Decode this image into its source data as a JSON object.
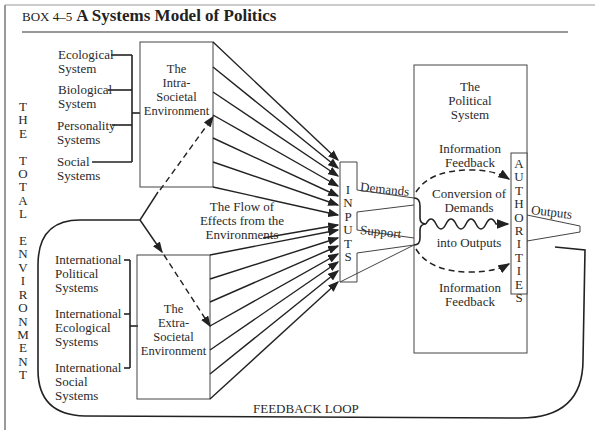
{
  "header": {
    "box_label": "BOX 4–5",
    "title": "A Systems Model of Politics"
  },
  "side_label": "T\nH\nE\n\nT\nO\nT\nA\nL\n\nE\nN\nV\nI\nR\nO\nN\nM\nE\nN\nT",
  "intra_sources": [
    {
      "label": "Ecological\nSystem"
    },
    {
      "label": "Biological\nSystem"
    },
    {
      "label": "Personality\nSystems"
    },
    {
      "label": "Social\nSystems"
    }
  ],
  "extra_sources": [
    {
      "label": "International\nPolitical\nSystems"
    },
    {
      "label": "International\nEcological\nSystems"
    },
    {
      "label": "International\nSocial\nSystems"
    }
  ],
  "intra_box": "The\nIntra-\nSocietal\nEnvironment",
  "extra_box": "The\nExtra-\nSocietal\nEnvironment",
  "flow_label": "The Flow of\nEffects from the\nEnvironments",
  "inputs_label": "I\nN\nP\nU\nT\nS",
  "demands_label": "Demands",
  "support_label": "Support",
  "political_system_label": "The\nPolitical\nSystem",
  "info_feedback_top": "Information\nFeedback",
  "info_feedback_bottom": "Information\nFeedback",
  "conversion_label_1": "Conversion of\nDemands",
  "conversion_label_2": "into Outputs",
  "authorities_label": "A\nU\nT\nH\nO\nR\nI\nT\nI\nE\nS",
  "outputs_label": "Outputs",
  "feedback_loop_label": "FEEDBACK LOOP"
}
